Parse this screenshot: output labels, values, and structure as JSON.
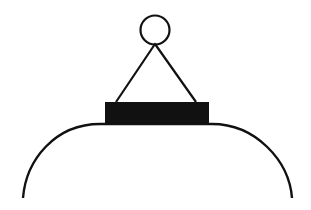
{
  "figure": {
    "colors": {
      "stroke": "#111111",
      "fill": "#111111",
      "background": "#ffffff"
    },
    "parts": [
      "ring",
      "hanger",
      "cap",
      "dome"
    ]
  }
}
